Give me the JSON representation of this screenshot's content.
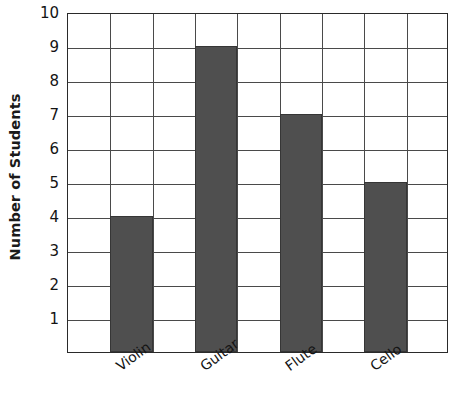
{
  "chart_data": {
    "type": "bar",
    "title": "",
    "subtitle": "",
    "xlabel": "",
    "ylabel": "Number of Students",
    "categories": [
      "Violin",
      "Guitar",
      "Flute",
      "Cello"
    ],
    "values": [
      4,
      9,
      7,
      5
    ],
    "ytick_labels": [
      "1",
      "2",
      "3",
      "4",
      "5",
      "6",
      "7",
      "8",
      "9",
      "10"
    ],
    "ytick_values": [
      1,
      2,
      3,
      4,
      5,
      6,
      7,
      8,
      9,
      10
    ],
    "ylim": [
      0,
      10
    ],
    "ystep": 1,
    "grid": "both",
    "grid_columns": 9,
    "bar_columns": [
      1,
      3,
      5,
      7
    ],
    "legend": "none",
    "annotations": [],
    "bar_color": "#4f4f4f",
    "bar_edge_color": "#363636",
    "grid_color": "#4a4a4a",
    "axis_color": "#2a2a2a",
    "xtick_rotation": -36
  }
}
